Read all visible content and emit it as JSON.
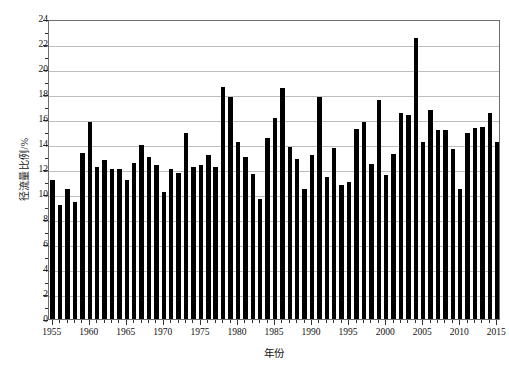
{
  "chart_data": {
    "type": "bar",
    "title": "",
    "xlabel": "年份",
    "ylabel": "径流量比例/%",
    "xlim": [
      1954.5,
      2015.5
    ],
    "ylim": [
      0,
      24
    ],
    "ytick_step": 2,
    "yticks": [
      0,
      2,
      4,
      6,
      8,
      10,
      12,
      14,
      16,
      18,
      20,
      22,
      24
    ],
    "ytick_labels": [
      "0",
      "2",
      "4",
      "6",
      "8",
      "10",
      "12",
      "14",
      "16",
      "18",
      "20",
      "22",
      "24"
    ],
    "xticks": [
      1955,
      1960,
      1965,
      1970,
      1975,
      1980,
      1985,
      1990,
      1995,
      2000,
      2005,
      2010,
      2015
    ],
    "xtick_labels": [
      "1955",
      "1960",
      "1965",
      "1970",
      "1975",
      "1980",
      "1985",
      "1990",
      "1995",
      "2000",
      "2005",
      "2010",
      "2015"
    ],
    "xtick_minor_step": 1,
    "grid": "horizontal",
    "legend": null,
    "bar_color": "#000000",
    "grid_color": "#bdbdbd",
    "axis_color": "#6e6e6e",
    "categories": [
      1955,
      1956,
      1957,
      1958,
      1959,
      1960,
      1961,
      1962,
      1963,
      1964,
      1965,
      1966,
      1967,
      1968,
      1969,
      1970,
      1971,
      1972,
      1973,
      1974,
      1975,
      1976,
      1977,
      1978,
      1979,
      1980,
      1981,
      1982,
      1983,
      1984,
      1985,
      1986,
      1987,
      1988,
      1989,
      1990,
      1991,
      1992,
      1993,
      1994,
      1995,
      1996,
      1997,
      1998,
      1999,
      2000,
      2001,
      2002,
      2003,
      2004,
      2005,
      2006,
      2007,
      2008,
      2009,
      2010,
      2011,
      2012,
      2013,
      2014,
      2015
    ],
    "values": [
      11.1,
      9.1,
      10.4,
      9.4,
      13.3,
      15.8,
      12.2,
      12.7,
      12.0,
      12.0,
      11.1,
      12.5,
      13.9,
      13.0,
      12.3,
      10.2,
      12.0,
      11.7,
      14.9,
      12.2,
      12.3,
      13.1,
      12.2,
      18.6,
      17.8,
      14.2,
      13.0,
      11.6,
      9.6,
      14.5,
      16.1,
      18.5,
      13.8,
      12.8,
      10.4,
      13.1,
      17.8,
      11.4,
      13.7,
      10.7,
      11.0,
      15.2,
      15.8,
      12.4,
      17.5,
      11.5,
      13.2,
      16.5,
      16.3,
      22.5,
      14.2,
      16.7,
      15.1,
      15.1,
      13.6,
      10.4,
      14.9,
      15.3,
      15.4,
      16.5,
      14.2
    ]
  }
}
